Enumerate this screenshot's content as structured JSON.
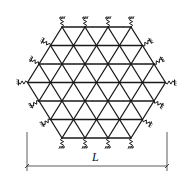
{
  "diagram": {
    "lattice": {
      "shape": "hexagon",
      "edges_per_side": 3,
      "row_node_counts": [
        4,
        5,
        6,
        7,
        6,
        5,
        4
      ],
      "boundary_supports": "spring"
    },
    "dimension": {
      "label": "L",
      "spans": "corner-to-corner width of hexagon"
    },
    "colors": {
      "line": "#1a1a1a",
      "background": "#ffffff"
    }
  }
}
